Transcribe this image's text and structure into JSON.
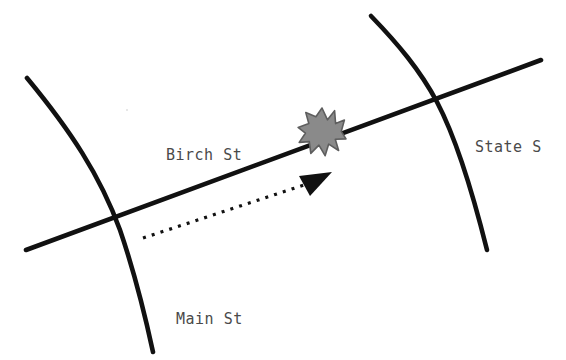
{
  "canvas": {
    "width": 566,
    "height": 360,
    "background": "#ffffff"
  },
  "colors": {
    "road_stroke": "#111111",
    "label_text": "#4a4a4a",
    "burst_fill": "#8a8a8a",
    "burst_stroke": "#5e5e5e",
    "arrow_stroke": "#111111",
    "arrow_head_fill": "#111111"
  },
  "labels": {
    "birch": "Birch St",
    "state": "State S",
    "main": "Main St"
  },
  "roads": [
    {
      "name": "birch-st",
      "label": "Birch St",
      "shape": "straight",
      "label_x": 166,
      "label_y": 160
    },
    {
      "name": "main-st",
      "label": "Main St",
      "shape": "curved",
      "label_x": 176,
      "label_y": 324
    },
    {
      "name": "state-st",
      "label": "State S",
      "shape": "curved",
      "label_x": 475,
      "label_y": 152
    }
  ],
  "markers": {
    "collision_burst": {
      "icon": "starburst-icon",
      "center_x": 322,
      "center_y": 132,
      "points": 11,
      "outer_radius": 24,
      "inner_radius": 13
    },
    "path_arrow": {
      "icon": "dotted-arrow-icon",
      "start_x": 143,
      "start_y": 238,
      "end_x": 325,
      "end_y": 178,
      "style": "dotted",
      "dot_size": 3
    }
  },
  "intersections": [
    {
      "name": "birch-main",
      "x": 114,
      "y": 215
    },
    {
      "name": "birch-state",
      "x": 437,
      "y": 100
    }
  ]
}
